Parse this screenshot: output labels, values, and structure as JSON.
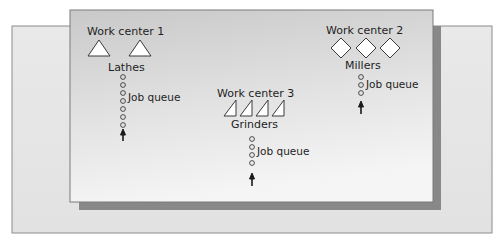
{
  "diagram": {
    "colors": {
      "back_panel": "#e6e6e6",
      "back_panel_border": "#8c8c8c",
      "front_panel_top": "#cccccc",
      "front_panel_bottom": "#f3f3f3",
      "front_panel_border": "#7a7a7a",
      "shadow": "#888888",
      "machine_fill": "#ffffff",
      "ink": "#1e1e1e"
    },
    "work_centers": [
      {
        "id": "wc1",
        "title": "Work center 1",
        "machine_type": "Lathes",
        "machine_shape": "triangle",
        "machine_count": 2,
        "queue_label": "Job queue",
        "queue_length": 7
      },
      {
        "id": "wc2",
        "title": "Work center 2",
        "machine_type": "Millers",
        "machine_shape": "diamond",
        "machine_count": 3,
        "queue_label": "Job queue",
        "queue_length": 3
      },
      {
        "id": "wc3",
        "title": "Work center 3",
        "machine_type": "Grinders",
        "machine_shape": "right-triangle",
        "machine_count": 4,
        "queue_label": "Job queue",
        "queue_length": 4
      }
    ]
  }
}
